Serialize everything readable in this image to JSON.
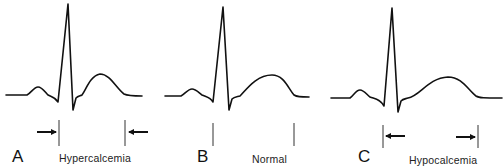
{
  "figure": {
    "panels": [
      {
        "letter": "A",
        "label": "Hypercalcemia",
        "qt_interval": "shortened",
        "arrows": "inward"
      },
      {
        "letter": "B",
        "label": "Normal",
        "qt_interval": "normal",
        "arrows": "none"
      },
      {
        "letter": "C",
        "label": "Hypocalcemia",
        "qt_interval": "prolonged",
        "arrows": "outward"
      }
    ],
    "colors": {
      "trace": "#111111",
      "background": "#ffffff"
    }
  }
}
